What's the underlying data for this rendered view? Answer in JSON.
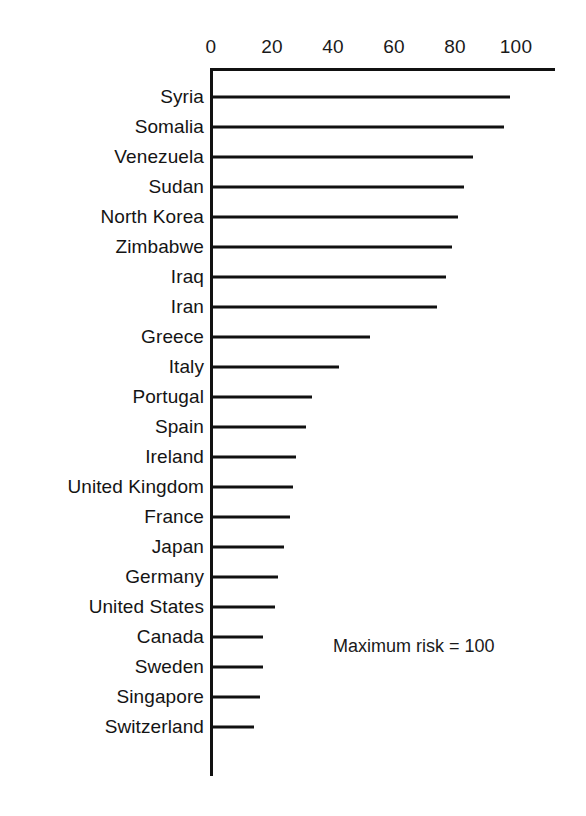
{
  "chart_data": {
    "type": "bar",
    "orientation": "horizontal",
    "title": "",
    "xlabel": "",
    "ylabel": "",
    "xlim": [
      0,
      113
    ],
    "axis_max_label": 100,
    "grid": false,
    "legend": null,
    "annotation": "Maximum risk = 100",
    "tick_labels": [
      "0",
      "20",
      "40",
      "60",
      "80",
      "100"
    ],
    "ticks": [
      0,
      20,
      40,
      60,
      80,
      100
    ],
    "categories": [
      "Syria",
      "Somalia",
      "Venezuela",
      "Sudan",
      "North Korea",
      "Zimbabwe",
      "Iraq",
      "Iran",
      "Greece",
      "Italy",
      "Portugal",
      "Spain",
      "Ireland",
      "United Kingdom",
      "France",
      "Japan",
      "Germany",
      "United States",
      "Canada",
      "Sweden",
      "Singapore",
      "Switzerland"
    ],
    "values": [
      98,
      96,
      86,
      83,
      81,
      79,
      77,
      74,
      52,
      42,
      33,
      31,
      28,
      27,
      26,
      24,
      22,
      21,
      17,
      17,
      16,
      14
    ],
    "series": [
      {
        "name": "Risk score",
        "values": [
          98,
          96,
          86,
          83,
          81,
          79,
          77,
          74,
          52,
          42,
          33,
          31,
          28,
          27,
          26,
          24,
          22,
          21,
          17,
          17,
          16,
          14
        ]
      }
    ],
    "colors": {
      "bar": "#111111",
      "axis": "#111111",
      "text": "#141414",
      "background": "#ffffff"
    }
  }
}
